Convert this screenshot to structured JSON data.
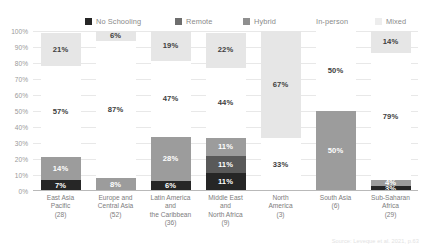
{
  "chart_data": {
    "type": "bar",
    "subtype": "stacked-100-percent",
    "title": "",
    "xlabel": "",
    "ylabel": "",
    "ylim": [
      0,
      100
    ],
    "ytick_labels": [
      "100%",
      "90%",
      "80%",
      "70%",
      "60%",
      "50%",
      "40%",
      "30%",
      "20%",
      "10%",
      "0%"
    ],
    "ytick_values": [
      100,
      90,
      80,
      70,
      60,
      50,
      40,
      30,
      20,
      10,
      0
    ],
    "grid": true,
    "legend_position": "top",
    "categories": [
      "East Asia Pacific (28)",
      "Europe and Central Asia (52)",
      "Latin America and the Caribbean (36)",
      "Middle East and North Africa (9)",
      "North America (3)",
      "South Asia (6)",
      "Sub-Saharan Africa (29)"
    ],
    "series": [
      {
        "name": "No Schooling",
        "color": "#262626",
        "label_color": "#ffffff",
        "values": [
          7,
          0,
          6,
          11,
          0,
          0,
          3
        ],
        "labels": [
          "7%",
          "",
          "6%",
          "11%",
          "",
          "",
          "3%"
        ]
      },
      {
        "name": "Remote",
        "color": "#595959",
        "label_color": "#ffffff",
        "values": [
          0,
          0,
          0,
          11,
          0,
          0,
          0
        ],
        "labels": [
          "",
          "",
          "",
          "11%",
          "",
          "",
          ""
        ]
      },
      {
        "name": "Hybrid",
        "color": "#9c9c9c",
        "label_color": "#ffffff",
        "values": [
          14,
          8,
          28,
          11,
          0,
          50,
          4
        ],
        "labels": [
          "14%",
          "8%",
          "28%",
          "11%",
          "",
          "50%",
          "4%"
        ]
      },
      {
        "name": "In-person",
        "color": "#ffffff",
        "label_color": "#404040",
        "values": [
          57,
          87,
          47,
          44,
          33,
          50,
          79
        ],
        "labels": [
          "57%",
          "87%",
          "47%",
          "44%",
          "33%",
          "50%",
          "79%"
        ]
      },
      {
        "name": "Mixed",
        "color": "#e6e6e6",
        "label_color": "#404040",
        "values": [
          21,
          6,
          19,
          22,
          67,
          0,
          14
        ],
        "labels": [
          "21%",
          "6%",
          "19%",
          "22%",
          "67%",
          "",
          "14%"
        ]
      }
    ]
  },
  "legend": {
    "items": [
      {
        "label": "No Schooling",
        "color": "#262626",
        "left": 85
      },
      {
        "label": "Remote",
        "color": "#6e6e6e",
        "left": 175
      },
      {
        "label": "Hybrid",
        "color": "#8f8f8f",
        "left": 243
      },
      {
        "label": "In-person",
        "color": "#ffffff",
        "left": 305
      },
      {
        "label": "Mixed",
        "color": "#ededed",
        "left": 375
      }
    ]
  },
  "xaxis": {
    "categories": [
      {
        "lines": [
          "East Asia",
          "Pacific"
        ],
        "count": "(28)"
      },
      {
        "lines": [
          "Europe and",
          "Central Asia"
        ],
        "count": "(52)"
      },
      {
        "lines": [
          "Latin America",
          "and",
          "the Caribbean"
        ],
        "count": "(36)"
      },
      {
        "lines": [
          "Middle East",
          "and",
          "North Africa"
        ],
        "count": "(9)"
      },
      {
        "lines": [
          "North",
          "America"
        ],
        "count": "(3)"
      },
      {
        "lines": [
          "South Asia"
        ],
        "count": "(6)"
      },
      {
        "lines": [
          "Sub-Saharan",
          "Africa"
        ],
        "count": "(29)"
      }
    ]
  },
  "footer": {
    "source": "Source: Leveque et al. 2021, p.63"
  }
}
